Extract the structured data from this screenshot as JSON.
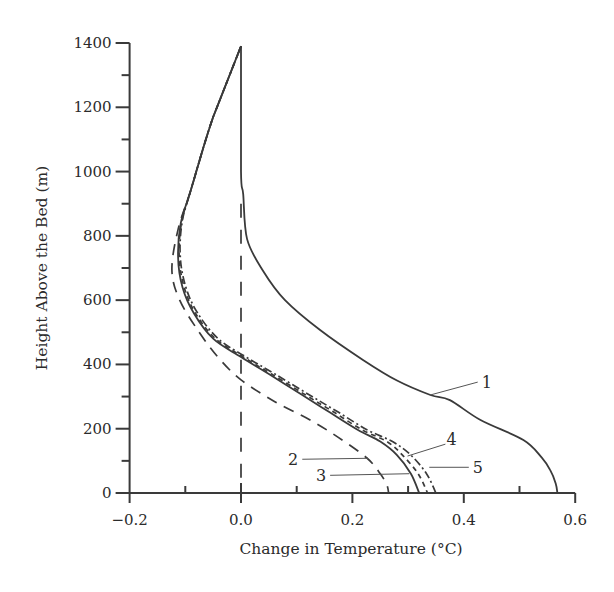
{
  "chart_data": {
    "type": "line",
    "title": "",
    "xlabel": "Change in Temperature (°C)",
    "ylabel": "Height Above the Bed (m)",
    "xlim": [
      -0.2,
      0.6
    ],
    "ylim": [
      0,
      1400
    ],
    "x_ticks": [
      -0.2,
      0.0,
      0.2,
      0.4,
      0.6
    ],
    "x_tick_labels": [
      "−0.2",
      "0.0",
      "0.2",
      "0.4",
      "0.6"
    ],
    "x_minor_ticks": [
      -0.1,
      0.1,
      0.3,
      0.5
    ],
    "y_ticks": [
      0,
      200,
      400,
      600,
      800,
      1000,
      1200,
      1400
    ],
    "y_tick_labels": [
      "0",
      "200",
      "400",
      "600",
      "800",
      "1000",
      "1200",
      "1400"
    ],
    "y_minor_ticks": [
      100,
      300,
      500,
      700,
      900,
      1100,
      1300
    ],
    "grid": false,
    "legend": "inline numeric labels with leader lines",
    "reference_line": {
      "x": 0.0,
      "style": "long-dash",
      "y_range": [
        0,
        900
      ]
    },
    "series": [
      {
        "name": "1",
        "style": "solid",
        "points": [
          [
            0.0,
            1390
          ],
          [
            0.0,
            1000
          ],
          [
            0.004,
            930
          ],
          [
            0.011,
            790
          ],
          [
            0.04,
            690
          ],
          [
            0.079,
            600
          ],
          [
            0.142,
            507
          ],
          [
            0.219,
            414
          ],
          [
            0.28,
            350
          ],
          [
            0.34,
            305
          ],
          [
            0.375,
            289
          ],
          [
            0.43,
            227
          ],
          [
            0.507,
            165
          ],
          [
            0.54,
            110
          ],
          [
            0.555,
            72
          ],
          [
            0.565,
            30
          ],
          [
            0.568,
            0
          ]
        ],
        "label_pos": [
          0.425,
          345
        ]
      },
      {
        "name": "2",
        "style": "long-dash",
        "points": [
          [
            0.0,
            1390
          ],
          [
            -0.05,
            1170
          ],
          [
            -0.09,
            943
          ],
          [
            -0.113,
            820
          ],
          [
            -0.124,
            694
          ],
          [
            -0.11,
            600
          ],
          [
            -0.075,
            500
          ],
          [
            -0.04,
            420
          ],
          [
            0.0,
            352
          ],
          [
            0.06,
            285
          ],
          [
            0.124,
            227
          ],
          [
            0.174,
            174
          ],
          [
            0.226,
            109
          ],
          [
            0.25,
            60
          ],
          [
            0.262,
            25
          ],
          [
            0.265,
            0
          ]
        ],
        "label_pos": [
          0.11,
          105
        ]
      },
      {
        "name": "3",
        "style": "solid",
        "points": [
          [
            0.0,
            1390
          ],
          [
            -0.05,
            1170
          ],
          [
            -0.09,
            943
          ],
          [
            -0.108,
            840
          ],
          [
            -0.113,
            734
          ],
          [
            -0.105,
            640
          ],
          [
            -0.085,
            560
          ],
          [
            -0.05,
            480
          ],
          [
            0.0,
            423
          ],
          [
            0.05,
            370
          ],
          [
            0.11,
            305
          ],
          [
            0.16,
            250
          ],
          [
            0.21,
            196
          ],
          [
            0.25,
            160
          ],
          [
            0.28,
            118
          ],
          [
            0.305,
            60
          ],
          [
            0.32,
            0
          ]
        ],
        "label_pos": [
          0.16,
          55
        ]
      },
      {
        "name": "4",
        "style": "short-dash",
        "points": [
          [
            0.0,
            1390
          ],
          [
            -0.05,
            1170
          ],
          [
            -0.09,
            943
          ],
          [
            -0.107,
            840
          ],
          [
            -0.111,
            734
          ],
          [
            -0.102,
            640
          ],
          [
            -0.082,
            560
          ],
          [
            -0.046,
            480
          ],
          [
            0.004,
            423
          ],
          [
            0.055,
            370
          ],
          [
            0.116,
            305
          ],
          [
            0.168,
            250
          ],
          [
            0.218,
            196
          ],
          [
            0.262,
            160
          ],
          [
            0.29,
            118
          ],
          [
            0.318,
            60
          ],
          [
            0.335,
            0
          ]
        ],
        "label_pos": [
          0.375,
          168
        ]
      },
      {
        "name": "5",
        "style": "dash-dot",
        "points": [
          [
            0.0,
            1390
          ],
          [
            -0.05,
            1170
          ],
          [
            -0.09,
            943
          ],
          [
            -0.106,
            840
          ],
          [
            -0.109,
            734
          ],
          [
            -0.099,
            640
          ],
          [
            -0.078,
            560
          ],
          [
            -0.041,
            480
          ],
          [
            0.009,
            423
          ],
          [
            0.061,
            370
          ],
          [
            0.123,
            305
          ],
          [
            0.176,
            250
          ],
          [
            0.227,
            196
          ],
          [
            0.272,
            160
          ],
          [
            0.305,
            118
          ],
          [
            0.333,
            60
          ],
          [
            0.35,
            0
          ]
        ],
        "label_pos": [
          0.43,
          80
        ]
      }
    ],
    "annotations": [
      {
        "text": "1",
        "leader_from": [
          0.425,
          345
        ],
        "leader_to": [
          0.34,
          305
        ]
      },
      {
        "text": "2",
        "leader_from": [
          0.11,
          105
        ],
        "leader_to": [
          0.228,
          108
        ]
      },
      {
        "text": "3",
        "leader_from": [
          0.16,
          55
        ],
        "leader_to": [
          0.302,
          60
        ]
      },
      {
        "text": "4",
        "leader_from": [
          0.367,
          152
        ],
        "leader_to": [
          0.299,
          115
        ]
      },
      {
        "text": "5",
        "leader_from": [
          0.409,
          80
        ],
        "leader_to": [
          0.338,
          80
        ]
      }
    ]
  }
}
